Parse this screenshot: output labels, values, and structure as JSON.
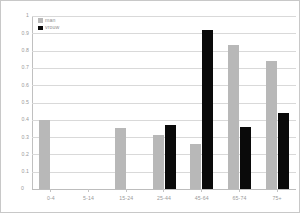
{
  "chart_data": {
    "type": "bar",
    "title": "",
    "xlabel": "",
    "ylabel": "",
    "categories": [
      "0-4",
      "5-14",
      "15-24",
      "25-44",
      "45-64",
      "65-74",
      "75+"
    ],
    "series": [
      {
        "name": "man",
        "color": "#b8b8b8",
        "values": [
          0.4,
          null,
          0.35,
          0.31,
          0.26,
          0.83,
          0.74
        ]
      },
      {
        "name": "vrouw",
        "color": "#0a0a0a",
        "values": [
          null,
          null,
          null,
          0.37,
          0.92,
          0.36,
          0.44
        ]
      }
    ],
    "ylim": [
      0,
      1
    ],
    "ytick_labels": [
      "1",
      "0.9",
      "0.8",
      "0.7",
      "0.6",
      "0.5",
      "0.4",
      "0.3",
      "0.2",
      "0.1",
      "0"
    ],
    "ytick_values": [
      1,
      0.9,
      0.8,
      0.7,
      0.6,
      0.5,
      0.4,
      0.3,
      0.2,
      0.1,
      0
    ],
    "grid": true,
    "legend_position": "top-left",
    "origin_label": "0"
  },
  "legend": {
    "items": [
      {
        "label": "man"
      },
      {
        "label": "vrouw"
      }
    ]
  }
}
